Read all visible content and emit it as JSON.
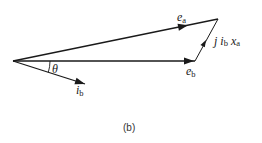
{
  "diagram": {
    "type": "phasor-diagram",
    "vectors": [
      {
        "id": "e_a",
        "label": "e",
        "subscript": "a",
        "from": "origin",
        "to": "tip-a"
      },
      {
        "id": "e_b",
        "label": "e",
        "subscript": "b",
        "from": "origin",
        "to": "tip-b"
      },
      {
        "id": "i_b",
        "label": "i",
        "subscript": "b",
        "from": "origin",
        "to": "tip-i"
      },
      {
        "id": "j_ib_xa",
        "label_prefix": "j",
        "label_i": "i",
        "subscript_i": "b",
        "label_x": "x",
        "subscript_x": "a",
        "from": "tip-b",
        "to": "tip-a"
      }
    ],
    "angle": {
      "label": "θ",
      "between": [
        "e_b",
        "i_b"
      ]
    },
    "caption": "(b)",
    "stroke_color": "#1a1a1a"
  }
}
